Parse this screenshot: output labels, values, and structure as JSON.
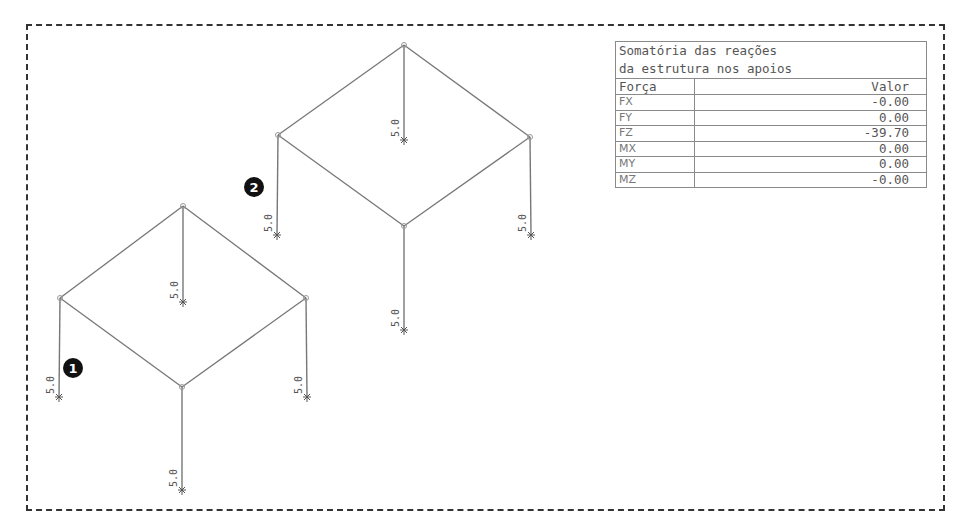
{
  "diagram": {
    "border_style": "dashed",
    "colors": {
      "member": "#777777",
      "border": "#333333",
      "badge_fill": "#111111",
      "badge_text": "#ffffff",
      "label": "#555555"
    },
    "frames": [
      {
        "id": "frame-1",
        "badge": "1",
        "badge_pos": [
          73,
          368
        ],
        "nodes": {
          "top": [
            183,
            206
          ],
          "left": [
            60,
            298
          ],
          "right": [
            306,
            298
          ],
          "front": [
            182,
            387
          ]
        },
        "columns": [
          {
            "node": "top",
            "bottom": [
              183,
              302
            ],
            "label": "5.0"
          },
          {
            "node": "left",
            "bottom": [
              59,
              397
            ],
            "label": "5.0"
          },
          {
            "node": "right",
            "bottom": [
              307,
              397
            ],
            "label": "5.0"
          },
          {
            "node": "front",
            "bottom": [
              182,
              490
            ],
            "label": "5.0"
          }
        ]
      },
      {
        "id": "frame-2",
        "badge": "2",
        "badge_pos": [
          254,
          187
        ],
        "nodes": {
          "top": [
            404,
            45
          ],
          "left": [
            278,
            135
          ],
          "right": [
            530,
            137
          ],
          "front": [
            404,
            226
          ]
        },
        "columns": [
          {
            "node": "top",
            "bottom": [
              404,
              140
            ],
            "label": "5.0"
          },
          {
            "node": "left",
            "bottom": [
              277,
              235
            ],
            "label": "5.0"
          },
          {
            "node": "right",
            "bottom": [
              531,
              235
            ],
            "label": "5.0"
          },
          {
            "node": "front",
            "bottom": [
              404,
              330
            ],
            "label": "5.0"
          }
        ]
      }
    ]
  },
  "results_table": {
    "title_line1": "Somatória das reações",
    "title_line2": "da estrutura nos apoios",
    "header": {
      "col1": "Força",
      "col2": "Valor"
    },
    "rows": [
      {
        "force": "FX",
        "value": "-0.00"
      },
      {
        "force": "FY",
        "value": "0.00"
      },
      {
        "force": "FZ",
        "value": "-39.70"
      },
      {
        "force": "MX",
        "value": "0.00"
      },
      {
        "force": "MY",
        "value": "0.00"
      },
      {
        "force": "MZ",
        "value": "-0.00"
      }
    ]
  }
}
